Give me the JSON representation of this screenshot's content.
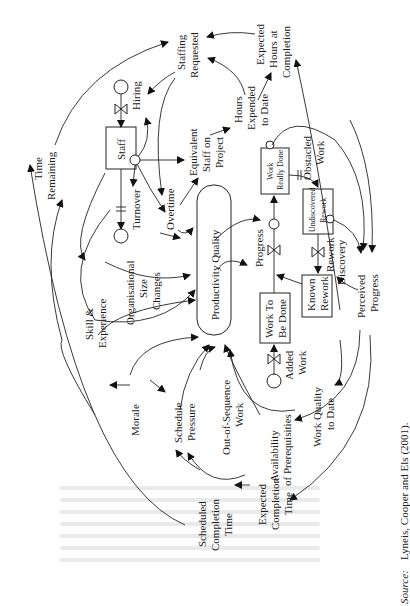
{
  "figure": {
    "orientation": "rotated-90-ccw",
    "source_label": "Source:",
    "source_text": "Lyneis, Cooper and Els (2001).",
    "stocks": {
      "staff": "Staff",
      "work_to_be_done_1": "Work To",
      "work_to_be_done_2": "Be Done",
      "work_really_done_1": "Work",
      "work_really_done_2": "Really Done",
      "undiscovered_rework_1": "Undiscovered",
      "undiscovered_rework_2": "Rework",
      "known_rework_1": "Known",
      "known_rework_2": "Rework",
      "productivity_quality": "Productivity Quality"
    },
    "flows": {
      "hiring": "Hiring",
      "turnover": "Turnover",
      "progress": "Progress",
      "rework": "Rework",
      "added_work_1": "Added",
      "added_work_2": "Work"
    },
    "variables": {
      "staffing_requested_1": "Staffing",
      "staffing_requested_2": "Requested",
      "time_remaining_1": "Time",
      "time_remaining_2": "Remaining",
      "equivalent_staff_1": "Equivalent",
      "equivalent_staff_2": "Staff on",
      "equivalent_staff_3": "Project",
      "hours_expended_1": "Hours",
      "hours_expended_2": "Expended",
      "hours_expended_3": "to Date",
      "expected_hours_1": "Expected",
      "expected_hours_2": "Hours at",
      "expected_hours_3": "Completion",
      "overtime": "Overtime",
      "obstacled_work_1": "Obstacled",
      "obstacled_work_2": "Work",
      "org_size_1": "Organisational",
      "org_size_2": "Size",
      "org_size_3": "Changes",
      "skill_1": "Skill &",
      "skill_2": "Experience",
      "discovery": "Discovery",
      "perceived_progress_1": "Perceived",
      "perceived_progress_2": "Progress",
      "morale": "Morale",
      "schedule_pressure_1": "Schedule",
      "schedule_pressure_2": "Pressure",
      "out_of_sequence_1": "Out-of-Sequence",
      "out_of_sequence_2": "Work",
      "availability_1": "Availability",
      "availability_2": "of Prerequisities",
      "work_quality_1": "Work Quality",
      "work_quality_2": "to Date",
      "scheduled_completion_1": "Scheduled",
      "scheduled_completion_2": "Completion",
      "scheduled_completion_3": "Time",
      "expected_completion_1": "Expected",
      "expected_completion_2": "Completion",
      "expected_completion_3": "Time"
    }
  }
}
